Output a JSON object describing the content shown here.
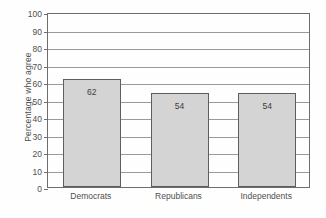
{
  "chart_data": {
    "type": "bar",
    "title": "",
    "xlabel": "",
    "ylabel": "Percentage who agree",
    "categories": [
      "Democrats",
      "Republicans",
      "Independents"
    ],
    "values": [
      62,
      54,
      54
    ],
    "value_labels": [
      "62",
      "54",
      "54"
    ],
    "ylim": [
      0,
      100
    ],
    "ytick_labels": [
      "0",
      "10",
      "20",
      "30",
      "40",
      "50",
      "60",
      "70",
      "80",
      "90",
      "100"
    ],
    "ytick_values": [
      0,
      10,
      20,
      30,
      40,
      50,
      60,
      70,
      80,
      90,
      100
    ],
    "grid": true,
    "grid_axis": "y",
    "legend": false,
    "colors": {
      "bar_fill": "#d4d4d4",
      "bar_edge": "#5e5e5e",
      "gridline": "#9a9a9a",
      "frame": "#6d6d6d",
      "text": "#4f4f4f",
      "background": "#fefefe"
    }
  }
}
